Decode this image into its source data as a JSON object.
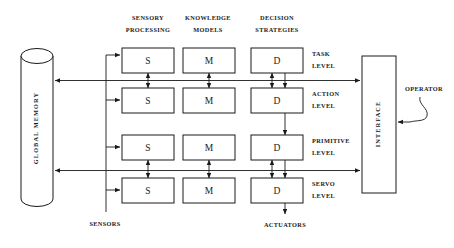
{
  "diagram": {
    "columns": [
      {
        "id": "sensory-processing",
        "line1": "SENSORY",
        "line2": "PROCESSING",
        "letter": "S"
      },
      {
        "id": "knowledge-models",
        "line1": "KNOWLEDGE",
        "line2": "MODELS",
        "letter": "M"
      },
      {
        "id": "decision-strategies",
        "line1": "DECISION",
        "line2": "STRATEGIES",
        "letter": "D"
      }
    ],
    "levels": [
      {
        "id": "task-level",
        "line1": "TASK",
        "line2": "LEVEL"
      },
      {
        "id": "action-level",
        "line1": "ACTION",
        "line2": "LEVEL"
      },
      {
        "id": "primitive-level",
        "line1": "PRIMITIVE",
        "line2": "LEVEL"
      },
      {
        "id": "servo-level",
        "line1": "SERVO",
        "line2": "LEVEL"
      }
    ],
    "memory": {
      "label": "GLOBAL  MEMORY"
    },
    "interface": {
      "label": "INTERFACE"
    },
    "operator": {
      "label": "OPERATOR"
    },
    "inputs": {
      "sensors": "SENSORS"
    },
    "outputs": {
      "actuators": "ACTUATORS"
    },
    "cells": [
      {
        "level": "task-level",
        "s": "S",
        "m": "M",
        "d": "D"
      },
      {
        "level": "action-level",
        "s": "S",
        "m": "M",
        "d": "D"
      },
      {
        "level": "primitive-level",
        "s": "S",
        "m": "M",
        "d": "D"
      },
      {
        "level": "servo-level",
        "s": "S",
        "m": "M",
        "d": "D"
      }
    ],
    "colors": {
      "stroke": "#1a1a1a",
      "background": "#ffffff",
      "fill": "#ffffff"
    }
  }
}
